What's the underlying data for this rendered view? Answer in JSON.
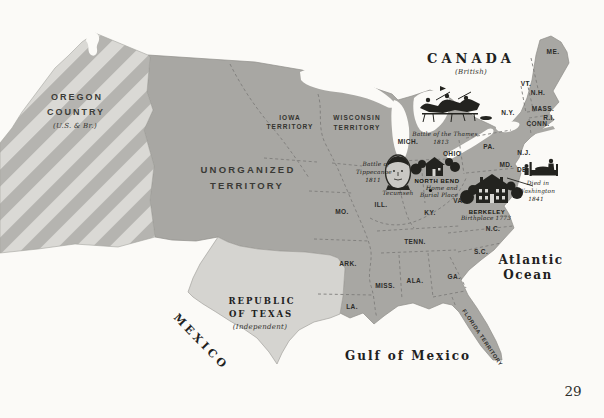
{
  "page": {
    "number": "29"
  },
  "colors": {
    "paper": "#fbfaf7",
    "land": "#a8a7a3",
    "oregon_base": "#dad9d5",
    "oregon_stripe": "#b5b4b0",
    "texas": "#d5d4d0",
    "border_dash": "#7e7d7a",
    "ink": "#23231f"
  },
  "labels": {
    "canada": {
      "name": "CANADA",
      "note": "(British)"
    },
    "oregon": {
      "line1": "OREGON",
      "line2": "COUNTRY",
      "note": "(U.S. & Br.)"
    },
    "unorganized": {
      "line1": "UNORGANIZED",
      "line2": "TERRITORY"
    },
    "iowa": {
      "line1": "IOWA",
      "line2": "TERRITORY"
    },
    "wisconsin": {
      "line1": "WISCONSIN",
      "line2": "TERRITORY"
    },
    "texas": {
      "line1": "REPUBLIC",
      "line2": "OF TEXAS",
      "note": "(Independent)"
    },
    "mexico": "MEXICO",
    "florida": "FLORIDA TERRITORY",
    "gulf": "Gulf of Mexico",
    "atlantic": {
      "line1": "Atlantic",
      "line2": "Ocean"
    }
  },
  "states": [
    {
      "abbr": "ME.",
      "x": 553,
      "y": 52
    },
    {
      "abbr": "VT.",
      "x": 526,
      "y": 84
    },
    {
      "abbr": "N.H.",
      "x": 538,
      "y": 93
    },
    {
      "abbr": "N.Y.",
      "x": 508,
      "y": 113
    },
    {
      "abbr": "MASS.",
      "x": 543,
      "y": 109
    },
    {
      "abbr": "R.I.",
      "x": 549,
      "y": 118
    },
    {
      "abbr": "CONN.",
      "x": 538,
      "y": 124
    },
    {
      "abbr": "PA.",
      "x": 489,
      "y": 147
    },
    {
      "abbr": "N.J.",
      "x": 524,
      "y": 153
    },
    {
      "abbr": "MD.",
      "x": 506,
      "y": 165
    },
    {
      "abbr": "DE.",
      "x": 523,
      "y": 170
    },
    {
      "abbr": "OHIO",
      "x": 452,
      "y": 154
    },
    {
      "abbr": "MICH.",
      "x": 408,
      "y": 142
    },
    {
      "abbr": "VA.",
      "x": 459,
      "y": 201
    },
    {
      "abbr": "N.C.",
      "x": 493,
      "y": 229
    },
    {
      "abbr": "S.C.",
      "x": 481,
      "y": 252
    },
    {
      "abbr": "GA.",
      "x": 454,
      "y": 277
    },
    {
      "abbr": "MO.",
      "x": 342,
      "y": 212
    },
    {
      "abbr": "ILL.",
      "x": 381,
      "y": 205
    },
    {
      "abbr": "KY.",
      "x": 430,
      "y": 213
    },
    {
      "abbr": "TENN.",
      "x": 415,
      "y": 242
    },
    {
      "abbr": "ARK.",
      "x": 348,
      "y": 264
    },
    {
      "abbr": "MISS.",
      "x": 385,
      "y": 286
    },
    {
      "abbr": "ALA.",
      "x": 415,
      "y": 281
    },
    {
      "abbr": "LA.",
      "x": 352,
      "y": 307
    }
  ],
  "annotations": {
    "thames": {
      "line1": "Battle of the Thames",
      "line2": "1813"
    },
    "tippecanoe": {
      "line1": "Battle of",
      "line2": "Tippecanoe",
      "line3": "1811"
    },
    "tecumseh": "Tecumseh",
    "north_bend": {
      "title": "NORTH BEND",
      "line2": "Home and",
      "line3": "Burial Place"
    },
    "berkeley": {
      "title": "BERKELEY",
      "sub": "Birthplace 1773"
    },
    "died": {
      "line1": "Died in",
      "line2": "Washington",
      "line3": "1841"
    }
  }
}
